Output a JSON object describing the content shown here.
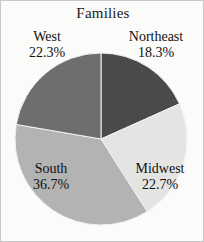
{
  "figure": {
    "background_color": "#fbfbfa",
    "border_color": "#c8c8c8"
  },
  "chart_data": {
    "type": "pie",
    "title": "Families",
    "xlabel": "",
    "ylabel": "",
    "legend_position": "none",
    "grid": false,
    "start_angle_deg": 0,
    "direction": "clockwise",
    "categories": [
      "Northeast",
      "Midwest",
      "South",
      "West"
    ],
    "values": [
      18.3,
      22.7,
      36.7,
      22.3
    ],
    "value_unit": "%",
    "colors": [
      "#4a4a4a",
      "#e4e4e2",
      "#b3b3b1",
      "#6e6e6e"
    ],
    "slices": [
      {
        "name": "Northeast",
        "percent": 18.3,
        "percent_label": "18.3%",
        "color": "#4a4a4a",
        "label_position": "outside-top-right"
      },
      {
        "name": "Midwest",
        "percent": 22.7,
        "percent_label": "22.7%",
        "color": "#e4e4e2",
        "label_position": "outside-bottom-right"
      },
      {
        "name": "South",
        "percent": 36.7,
        "percent_label": "36.7%",
        "color": "#b3b3b1",
        "label_position": "outside-bottom-left"
      },
      {
        "name": "West",
        "percent": 22.3,
        "percent_label": "22.3%",
        "color": "#6e6e6e",
        "label_position": "outside-top-left"
      }
    ],
    "geometry": {
      "center_x": 100,
      "center_y": 138,
      "radius": 86
    }
  }
}
